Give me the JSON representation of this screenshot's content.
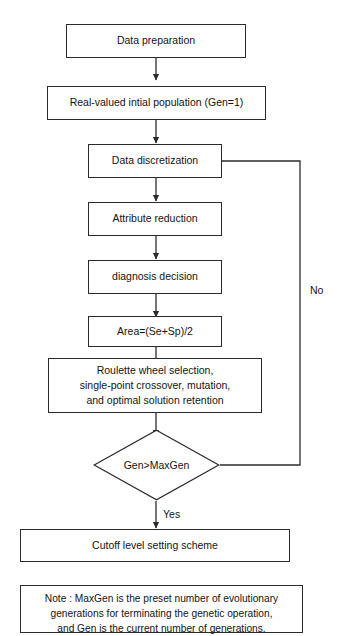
{
  "diagram": {
    "type": "flowchart",
    "line_color": "#2b2b2b",
    "background_color": "#ffffff",
    "nodes": [
      {
        "id": "data-preparation",
        "shape": "process",
        "label": "Data preparation"
      },
      {
        "id": "initial-population",
        "shape": "process",
        "label": "Real-valued intial population (Gen=1)"
      },
      {
        "id": "data-discretization",
        "shape": "process",
        "label": "Data discretization"
      },
      {
        "id": "attribute-reduction",
        "shape": "process",
        "label": "Attribute reduction"
      },
      {
        "id": "diagnosis-decision",
        "shape": "process",
        "label": "diagnosis decision"
      },
      {
        "id": "area-formula",
        "shape": "process",
        "label": "Area=(Se+Sp)/2"
      },
      {
        "id": "genetic-operations",
        "shape": "process",
        "label_line1": "Roulette wheel selection,",
        "label_line2": "single-point crossover, mutation,",
        "label_line3": "and optimal solution retention"
      },
      {
        "id": "gen-max-gen-decision",
        "shape": "decision",
        "label": "Gen>MaxGen"
      },
      {
        "id": "cutoff-level-scheme",
        "shape": "process",
        "label": "Cutoff level setting scheme"
      }
    ],
    "edge_labels": {
      "no": "No",
      "yes": "Yes"
    },
    "note": {
      "line1": "Note : MaxGen is the preset number of evolutionary",
      "line2": "generations for terminating the genetic operation,",
      "line3": "and Gen is the current number of generations."
    }
  }
}
